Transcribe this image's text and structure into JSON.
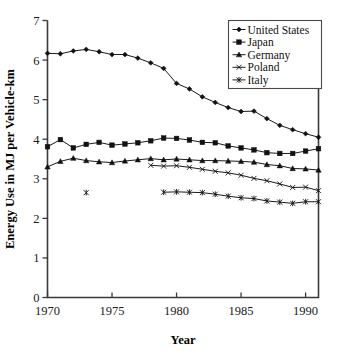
{
  "chart_data": {
    "type": "line",
    "title": "",
    "xlabel": "Year",
    "ylabel": "Energy Use in MJ per Vehicle-km",
    "xlim": [
      1970,
      1991
    ],
    "ylim": [
      0,
      7
    ],
    "xticks": [
      1970,
      1975,
      1980,
      1985,
      1990
    ],
    "yticks": [
      0,
      1,
      2,
      3,
      4,
      5,
      6,
      7
    ],
    "xtick_labels": [
      "1970",
      "1975",
      "1980",
      "1985",
      "1990"
    ],
    "ytick_labels": [
      "0",
      "1",
      "2",
      "3",
      "4",
      "5",
      "6",
      "7"
    ],
    "grid": false,
    "legend_position": "top-right",
    "series": [
      {
        "name": "United States",
        "marker": "diamond",
        "x": [
          1970,
          1971,
          1972,
          1973,
          1974,
          1975,
          1976,
          1977,
          1978,
          1979,
          1980,
          1981,
          1982,
          1983,
          1984,
          1985,
          1986,
          1987,
          1988,
          1989,
          1990,
          1991
        ],
        "values": [
          6.17,
          6.16,
          6.23,
          6.27,
          6.21,
          6.14,
          6.14,
          6.05,
          5.93,
          5.79,
          5.41,
          5.27,
          5.07,
          4.93,
          4.8,
          4.7,
          4.71,
          4.52,
          4.35,
          4.24,
          4.14,
          4.05
        ]
      },
      {
        "name": "Japan",
        "marker": "square",
        "x": [
          1970,
          1971,
          1972,
          1973,
          1974,
          1975,
          1976,
          1977,
          1978,
          1979,
          1980,
          1981,
          1982,
          1983,
          1984,
          1985,
          1986,
          1987,
          1988,
          1989,
          1990,
          1991
        ],
        "values": [
          3.81,
          3.99,
          3.78,
          3.87,
          3.92,
          3.85,
          3.88,
          3.91,
          3.96,
          4.03,
          4.02,
          3.98,
          3.92,
          3.91,
          3.83,
          3.78,
          3.73,
          3.66,
          3.64,
          3.64,
          3.7,
          3.76
        ]
      },
      {
        "name": "Germany",
        "marker": "triangle",
        "x": [
          1970,
          1971,
          1972,
          1973,
          1974,
          1975,
          1976,
          1977,
          1978,
          1979,
          1980,
          1981,
          1982,
          1983,
          1984,
          1985,
          1986,
          1987,
          1988,
          1989,
          1990,
          1991
        ],
        "values": [
          3.3,
          3.44,
          3.52,
          3.46,
          3.43,
          3.41,
          3.45,
          3.48,
          3.51,
          3.48,
          3.5,
          3.48,
          3.46,
          3.46,
          3.45,
          3.44,
          3.42,
          3.36,
          3.33,
          3.26,
          3.25,
          3.22
        ]
      },
      {
        "name": "Poland",
        "marker": "x-bar",
        "x": [
          1978,
          1979,
          1980,
          1981,
          1982,
          1983,
          1984,
          1985,
          1986,
          1987,
          1988,
          1989,
          1990,
          1991
        ],
        "values": [
          3.34,
          3.32,
          3.33,
          3.29,
          3.24,
          3.19,
          3.15,
          3.09,
          3.01,
          2.95,
          2.87,
          2.78,
          2.79,
          2.7
        ]
      },
      {
        "name": "Italy",
        "marker": "asterisk",
        "x": [
          1979,
          1980,
          1981,
          1982,
          1983,
          1984,
          1985,
          1986,
          1987,
          1988,
          1989,
          1990,
          1991
        ],
        "values": [
          2.66,
          2.67,
          2.66,
          2.65,
          2.61,
          2.56,
          2.52,
          2.5,
          2.44,
          2.41,
          2.38,
          2.42,
          2.42
        ]
      },
      {
        "name": "Italy",
        "marker": "asterisk",
        "isolated": true,
        "x": [
          1973
        ],
        "values": [
          2.65
        ]
      }
    ]
  },
  "legend": {
    "entries": [
      {
        "label": "United States",
        "marker": "diamond"
      },
      {
        "label": "Japan",
        "marker": "square"
      },
      {
        "label": "Germany",
        "marker": "triangle"
      },
      {
        "label": "Poland",
        "marker": "x-bar"
      },
      {
        "label": "Italy",
        "marker": "asterisk"
      }
    ]
  }
}
